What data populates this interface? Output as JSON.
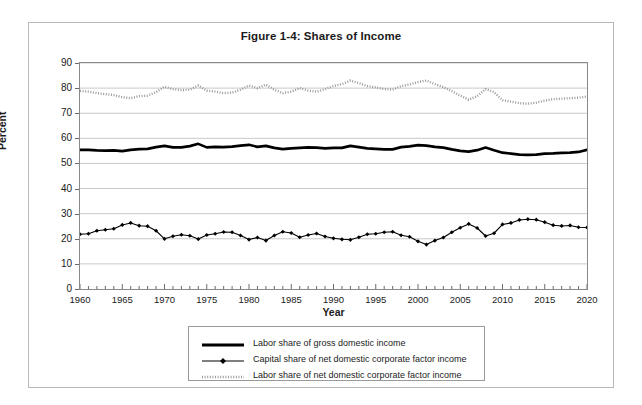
{
  "figure": {
    "title": "Figure 1-4: Shares of Income",
    "y_axis_title": "Percent",
    "x_axis_title": "Year"
  },
  "chart_data": {
    "type": "line",
    "title": "Figure 1-4: Shares of Income",
    "xlabel": "Year",
    "ylabel": "Percent",
    "xlim": [
      1960,
      2020
    ],
    "ylim": [
      0,
      90
    ],
    "ytick_values": [
      0,
      10,
      20,
      30,
      40,
      50,
      60,
      70,
      80,
      90
    ],
    "xtick_values": [
      1960,
      1965,
      1970,
      1975,
      1980,
      1985,
      1990,
      1995,
      2000,
      2005,
      2010,
      2015,
      2020
    ],
    "xtick_labels": [
      "1960",
      "1965",
      "1970",
      "1975",
      "1980",
      "1985",
      "1990",
      "1995",
      "2000",
      "2005",
      "2010",
      "2015",
      "2020"
    ],
    "ytick_labels": [
      "0",
      "10",
      "20",
      "30",
      "40",
      "50",
      "60",
      "70",
      "80",
      "90"
    ],
    "minor_xticks": "annual",
    "grid": "horizontal",
    "legend_position": "below-plot",
    "x": [
      1960,
      1961,
      1962,
      1963,
      1964,
      1965,
      1966,
      1967,
      1968,
      1969,
      1970,
      1971,
      1972,
      1973,
      1974,
      1975,
      1976,
      1977,
      1978,
      1979,
      1980,
      1981,
      1982,
      1983,
      1984,
      1985,
      1986,
      1987,
      1988,
      1989,
      1990,
      1991,
      1992,
      1993,
      1994,
      1995,
      1996,
      1997,
      1998,
      1999,
      2000,
      2001,
      2002,
      2003,
      2004,
      2005,
      2006,
      2007,
      2008,
      2009,
      2010,
      2011,
      2012,
      2013,
      2014,
      2015,
      2016,
      2017,
      2018,
      2019,
      2020
    ],
    "series": [
      {
        "name": "Labor share of gross domestic income",
        "style": "thick-solid-black",
        "color": "#000000",
        "values": [
          55.4,
          55.4,
          55.2,
          55.1,
          55.2,
          54.9,
          55.4,
          55.7,
          55.8,
          56.5,
          57.0,
          56.4,
          56.4,
          56.9,
          57.8,
          56.4,
          56.6,
          56.5,
          56.7,
          57.1,
          57.4,
          56.6,
          57.0,
          56.2,
          55.7,
          56.0,
          56.2,
          56.4,
          56.3,
          56.0,
          56.2,
          56.2,
          57.0,
          56.5,
          56.0,
          55.8,
          55.6,
          55.6,
          56.5,
          56.8,
          57.3,
          57.1,
          56.6,
          56.3,
          55.6,
          55.0,
          54.7,
          55.3,
          56.3,
          55.3,
          54.3,
          53.9,
          53.5,
          53.4,
          53.5,
          53.9,
          54.0,
          54.2,
          54.3,
          54.6,
          55.4
        ]
      },
      {
        "name": "Capital share of net domestic corporate factor income",
        "style": "thin-solid-black-with-diamond-markers",
        "color": "#000000",
        "values": [
          21.8,
          22.0,
          23.2,
          23.6,
          24.0,
          25.5,
          26.3,
          25.2,
          25.0,
          23.2,
          20.0,
          21.0,
          21.6,
          21.2,
          19.9,
          21.5,
          22.0,
          22.7,
          22.6,
          21.3,
          19.7,
          20.5,
          19.3,
          21.3,
          22.8,
          22.3,
          20.6,
          21.5,
          22.1,
          20.9,
          20.2,
          19.8,
          19.6,
          20.6,
          21.8,
          22.0,
          22.6,
          22.8,
          21.4,
          20.8,
          19.0,
          17.7,
          19.3,
          20.5,
          22.6,
          24.4,
          25.9,
          24.3,
          21.1,
          22.2,
          25.7,
          26.3,
          27.5,
          27.8,
          27.6,
          26.6,
          25.4,
          25.1,
          25.3,
          24.6,
          24.5
        ]
      },
      {
        "name": "Labor share of net domestic corporate factor income",
        "style": "dotted-light-gray",
        "color": "#9a9a9a",
        "values": [
          78.9,
          78.6,
          78.0,
          77.6,
          77.2,
          76.4,
          76.0,
          76.8,
          77.0,
          78.4,
          80.6,
          79.6,
          79.2,
          79.4,
          81.0,
          79.0,
          78.6,
          78.0,
          78.2,
          79.4,
          81.0,
          80.0,
          81.4,
          79.4,
          78.0,
          78.6,
          80.0,
          79.0,
          78.6,
          79.6,
          80.8,
          81.6,
          83.0,
          82.0,
          80.8,
          80.3,
          79.6,
          79.4,
          80.8,
          81.4,
          82.4,
          83.0,
          81.6,
          80.4,
          78.8,
          77.0,
          75.4,
          76.8,
          79.6,
          78.4,
          75.2,
          74.6,
          74.0,
          73.8,
          74.2,
          75.0,
          75.6,
          75.8,
          76.0,
          76.2,
          76.6
        ]
      }
    ]
  },
  "legend": {
    "items": [
      {
        "label": "Labor share of gross domestic income",
        "swatch": "thick-line-swatch"
      },
      {
        "label": "Capital share of net domestic corporate factor income",
        "swatch": "marker-line-swatch"
      },
      {
        "label": "Labor share of net domestic corporate factor income",
        "swatch": "dotted-line-swatch"
      }
    ]
  }
}
